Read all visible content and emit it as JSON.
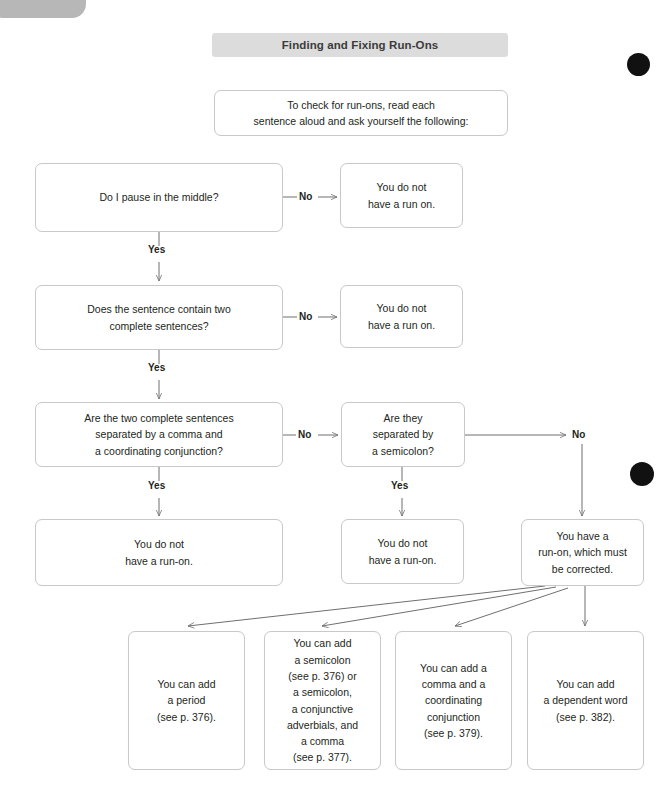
{
  "page": {
    "title": "Finding and Fixing Run-Ons",
    "width": 670,
    "height": 806,
    "background": "#ffffff",
    "accent_banner_color": "#dcdcdc",
    "box_border_color": "#c9c9c9",
    "text_color": "#231f20",
    "dot_color": "#111111"
  },
  "intro": {
    "text": "To check for run-ons, read each\nsentence aloud and ask yourself the following:"
  },
  "decisions": [
    {
      "id": "pause",
      "question": "Do I pause in the middle?",
      "no_label": "No",
      "yes_label": "Yes",
      "no_result": "You do not\nhave a run on."
    },
    {
      "id": "two-sentences",
      "question": "Does the sentence contain two\ncomplete sentences?",
      "no_label": "No",
      "yes_label": "Yes",
      "no_result": "You do not\nhave a run on."
    },
    {
      "id": "comma-conjunction",
      "question": "Are the two complete sentences\nseparated by a comma and\na coordinating conjunction?",
      "no_label": "No",
      "yes_label": "Yes",
      "yes_result": "You do not\nhave a run-on."
    },
    {
      "id": "semicolon",
      "question": "Are they\nseparated by\na semicolon?",
      "no_label": "No",
      "yes_label": "Yes",
      "yes_result": "You do not\nhave a run-on.",
      "no_result": "You have a\nrun-on, which must\nbe corrected."
    }
  ],
  "fixes": [
    {
      "id": "period",
      "text": "You can add\na period\n(see p. 376)."
    },
    {
      "id": "semicolon-or-conjunctive",
      "text": "You can add\na semicolon\n(see p. 376) or\na semicolon,\na conjunctive\nadverbials, and\na comma\n(see p. 377)."
    },
    {
      "id": "comma-coordinating",
      "text": "You can add a\ncomma and a\ncoordinating\nconjunction\n(see p. 379)."
    },
    {
      "id": "dependent-word",
      "text": "You can add\na dependent word\n(see p. 382)."
    }
  ]
}
